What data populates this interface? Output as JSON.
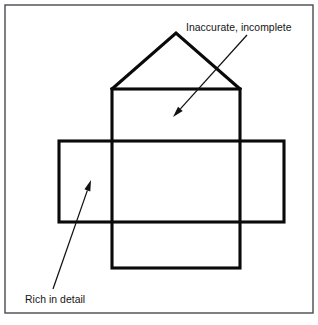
{
  "figure": {
    "background_color": "#ffffff",
    "frame": {
      "name": "outer-border",
      "stroke_color": "#4a4a50",
      "x": 5,
      "y": 5,
      "width": 308,
      "height": 308
    },
    "drawing": {
      "stroke_color": "#0a0a0a",
      "stroke_width": 3.1,
      "shapes": [
        {
          "name": "roof-triangle",
          "type": "polyline",
          "points": "112,89 176,33 240,89"
        },
        {
          "name": "vertical-rectangle",
          "type": "rect",
          "x": 112,
          "y": 89,
          "width": 128,
          "height": 179
        },
        {
          "name": "horizontal-rectangle",
          "type": "rect",
          "x": 59,
          "y": 141,
          "width": 225,
          "height": 81
        }
      ]
    },
    "callouts": [
      {
        "name": "inaccurate-incomplete-callout",
        "label": "Inaccurate, incomplete",
        "text_x": 186,
        "text_y": 31,
        "line_from_x": 247,
        "line_from_y": 35,
        "line_to_x": 173,
        "line_to_y": 117,
        "arrow_angle_deg": 132
      },
      {
        "name": "rich-in-detail-callout",
        "label": "Rich in detail",
        "text_x": 25,
        "text_y": 303,
        "line_from_x": 53,
        "line_from_y": 289,
        "line_to_x": 91,
        "line_to_y": 180,
        "arrow_angle_deg": -71
      }
    ]
  }
}
